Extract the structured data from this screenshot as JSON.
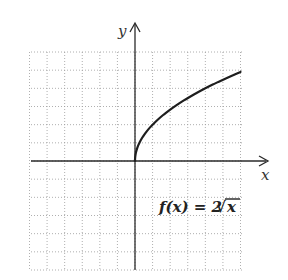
{
  "chart_data": {
    "type": "line",
    "title": "",
    "function_label": "f(x) = 2√x",
    "function_label_parts": {
      "lhs": "f(x) = 2",
      "radical": "√",
      "radicand": "x"
    },
    "xlabel": "x",
    "ylabel": "y",
    "xlim": [
      -6,
      6
    ],
    "ylim": [
      -6,
      6
    ],
    "grid": true,
    "grid_style": "dotted",
    "grid_step": 1,
    "tick_labels": false,
    "legend": null,
    "series": [
      {
        "name": "f(x) = 2√x",
        "x": [
          0,
          0.25,
          0.5,
          1,
          1.5,
          2,
          3,
          4,
          5,
          6
        ],
        "y": [
          0,
          1.0,
          1.41,
          2.0,
          2.45,
          2.83,
          3.46,
          4.0,
          4.47,
          4.9
        ]
      }
    ]
  },
  "axes": {
    "x_label": "x",
    "y_label": "y"
  }
}
